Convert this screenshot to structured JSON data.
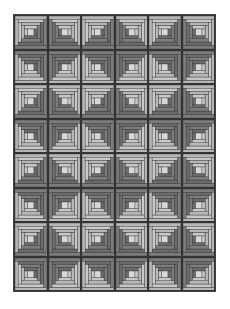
{
  "quilt": {
    "pattern": "log-cabin",
    "columns": 6,
    "rows": 8,
    "colors": {
      "light": "#b6b6b6",
      "light_alt": "#c8c8c8",
      "dark": "#7c7c7c",
      "dark_alt": "#6a6a6a",
      "center": "#d8d8d8",
      "outline": "#333333"
    },
    "rings": 4,
    "blocks_dark_sides": [
      [
        "br",
        "bl",
        "br",
        "bl",
        "br",
        "bl"
      ],
      [
        "tr",
        "tl",
        "tr",
        "tl",
        "tr",
        "tl"
      ],
      [
        "br",
        "bl",
        "br",
        "bl",
        "br",
        "bl"
      ],
      [
        "tr",
        "tl",
        "tr",
        "tl",
        "tr",
        "tl"
      ],
      [
        "br",
        "bl",
        "br",
        "bl",
        "br",
        "bl"
      ],
      [
        "tr",
        "tl",
        "tr",
        "tl",
        "tr",
        "tl"
      ],
      [
        "br",
        "bl",
        "br",
        "bl",
        "br",
        "bl"
      ],
      [
        "tr",
        "tl",
        "tr",
        "tl",
        "tr",
        "tl"
      ]
    ]
  }
}
